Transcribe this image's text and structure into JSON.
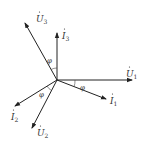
{
  "diagram": {
    "type": "phasor-diagram",
    "origin": [
      57,
      80
    ],
    "color": "#222222",
    "phasors": [
      {
        "id": "U1",
        "symbol": "U",
        "subscript": "1",
        "dot": true,
        "end": [
          132,
          80
        ],
        "label_pos": [
          126,
          74
        ]
      },
      {
        "id": "I1",
        "symbol": "I",
        "subscript": "1",
        "dot": true,
        "end": [
          106,
          99
        ],
        "label_pos": [
          110,
          102
        ]
      },
      {
        "id": "I3",
        "symbol": "I",
        "subscript": "3",
        "dot": true,
        "end": [
          57,
          33
        ],
        "label_pos": [
          62,
          37
        ]
      },
      {
        "id": "U3",
        "symbol": "U",
        "subscript": "3",
        "dot": true,
        "end": [
          25,
          23
        ],
        "label_pos": [
          36,
          20
        ]
      },
      {
        "id": "I2",
        "symbol": "I",
        "subscript": "2",
        "dot": true,
        "end": [
          15,
          106
        ],
        "label_pos": [
          11,
          120
        ]
      },
      {
        "id": "U2",
        "symbol": "U",
        "subscript": "2",
        "dot": true,
        "end": [
          32,
          128
        ],
        "label_pos": [
          37,
          136
        ]
      }
    ],
    "angles": [
      {
        "label": "φ",
        "pos": [
          47,
          62
        ],
        "between": [
          "U3",
          "I3"
        ]
      },
      {
        "label": "φ",
        "pos": [
          81,
          90
        ],
        "between": [
          "U1",
          "I1"
        ]
      },
      {
        "label": "φ",
        "pos": [
          39,
          97
        ],
        "between": [
          "I2",
          "U2"
        ]
      }
    ]
  },
  "labels": {
    "U1": "U",
    "U1_sub": "1",
    "I1": "I",
    "I1_sub": "1",
    "I3": "I",
    "I3_sub": "3",
    "U3": "U",
    "U3_sub": "3",
    "I2": "I",
    "I2_sub": "2",
    "U2": "U",
    "U2_sub": "2",
    "phi": "φ"
  }
}
